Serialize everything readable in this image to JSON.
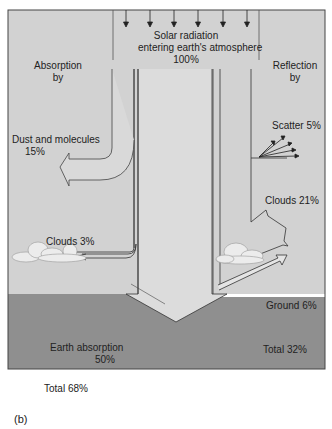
{
  "figure": {
    "caption": "(b)",
    "colors": {
      "sky": "#d2d2d2",
      "ground": "#8f8f8f",
      "stroke": "#333333",
      "frame": "#444444"
    }
  },
  "incoming": {
    "line1": "Solar radiation",
    "line2": "entering earth's atmosphere",
    "line3": "100%",
    "arrow_count": 6
  },
  "absorption": {
    "heading_line1": "Absorption",
    "heading_line2": "by",
    "dust": {
      "line1": "Dust and molecules",
      "line2": "15%"
    },
    "clouds": "Clouds 3%",
    "earth": {
      "line1": "Earth absorption",
      "line2": "50%"
    },
    "total": "Total 68%"
  },
  "reflection": {
    "heading_line1": "Reflection",
    "heading_line2": "by",
    "scatter": "Scatter 5%",
    "clouds": "Clouds 21%",
    "ground": "Ground 6%",
    "total": "Total 32%"
  }
}
